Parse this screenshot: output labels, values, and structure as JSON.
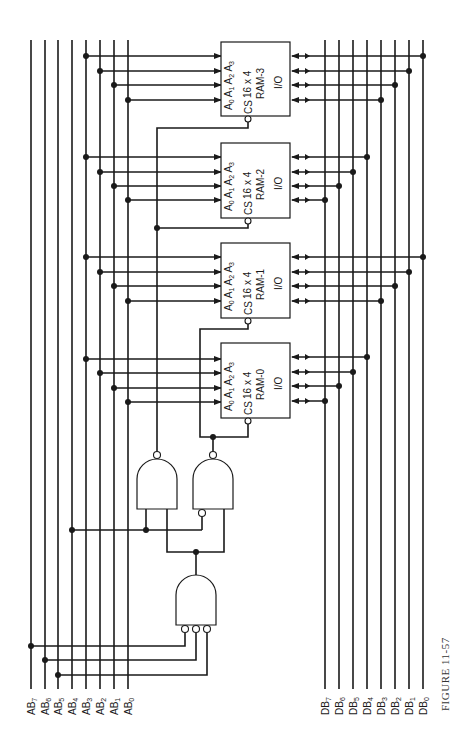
{
  "figure": {
    "caption": "FIGURE 11-57",
    "orientation": "rotated 90° counter-clockwise"
  },
  "address_bus": {
    "label": "Address bus",
    "lines": [
      {
        "name": "AB",
        "sub": "7",
        "x": 31
      },
      {
        "name": "AB",
        "sub": "6",
        "x": 45
      },
      {
        "name": "AB",
        "sub": "5",
        "x": 58
      },
      {
        "name": "AB",
        "sub": "4",
        "x": 72
      },
      {
        "name": "AB",
        "sub": "3",
        "x": 86
      },
      {
        "name": "AB",
        "sub": "2",
        "x": 100
      },
      {
        "name": "AB",
        "sub": "1",
        "x": 114
      },
      {
        "name": "AB",
        "sub": "0",
        "x": 128
      }
    ]
  },
  "data_bus": {
    "label": "Data bus",
    "lines": [
      {
        "name": "DB",
        "sub": "7",
        "x": 325
      },
      {
        "name": "DB",
        "sub": "6",
        "x": 339
      },
      {
        "name": "DB",
        "sub": "5",
        "x": 353
      },
      {
        "name": "DB",
        "sub": "4",
        "x": 367
      },
      {
        "name": "DB",
        "sub": "3",
        "x": 381
      },
      {
        "name": "DB",
        "sub": "2",
        "x": 395
      },
      {
        "name": "DB",
        "sub": "1",
        "x": 409
      },
      {
        "name": "DB",
        "sub": "0",
        "x": 423
      }
    ]
  },
  "rams": [
    {
      "id": "RAM-3",
      "size": "16 x 4",
      "io": "I/O",
      "cs": "CS",
      "addr_pins": [
        "A0",
        "A1",
        "A2",
        "A3"
      ],
      "y": 42,
      "data_bits": [
        "DB0",
        "DB1",
        "DB2",
        "DB3"
      ]
    },
    {
      "id": "RAM-2",
      "size": "16 x 4",
      "io": "I/O",
      "cs": "CS",
      "addr_pins": [
        "A0",
        "A1",
        "A2",
        "A3"
      ],
      "y": 143,
      "data_bits": [
        "DB4",
        "DB5",
        "DB6",
        "DB7"
      ]
    },
    {
      "id": "RAM-1",
      "size": "16 x 4",
      "io": "I/O",
      "cs": "CS",
      "addr_pins": [
        "A0",
        "A1",
        "A2",
        "A3"
      ],
      "y": 243,
      "data_bits": [
        "DB0",
        "DB1",
        "DB2",
        "DB3"
      ]
    },
    {
      "id": "RAM-0",
      "size": "16 x 4",
      "io": "I/O",
      "cs": "CS",
      "addr_pins": [
        "A0",
        "A1",
        "A2",
        "A3"
      ],
      "y": 343,
      "data_bits": [
        "DB4",
        "DB5",
        "DB6",
        "DB7"
      ]
    }
  ],
  "gates": [
    {
      "id": "decoder-and",
      "type": "NAND/AND with 3 inverted inputs",
      "inputs": [
        "AB7",
        "AB6",
        "AB5"
      ]
    },
    {
      "id": "upper-nand",
      "type": "NAND",
      "inputs": [
        "AB4",
        "decoder-out"
      ],
      "drives": [
        "RAM-3 CS",
        "RAM-2 CS"
      ]
    },
    {
      "id": "lower-nand",
      "type": "NAND (one inverted input)",
      "inputs": [
        "NOT AB4",
        "decoder-out"
      ],
      "drives": [
        "RAM-1 CS",
        "RAM-0 CS"
      ]
    }
  ]
}
